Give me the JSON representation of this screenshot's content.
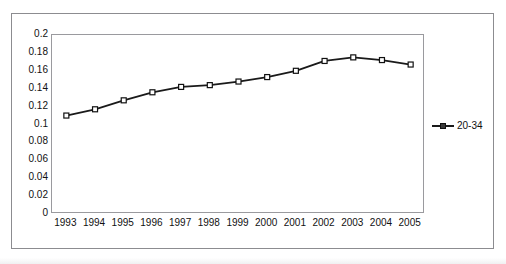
{
  "figure": {
    "cropped_header_text": "",
    "legend_position": "right",
    "grid": false
  },
  "chart_data": {
    "type": "line",
    "title": "",
    "subtitle": "",
    "xlabel": "",
    "ylabel": "",
    "categories": [
      "1993",
      "1994",
      "1995",
      "1996",
      "1997",
      "1998",
      "1999",
      "2000",
      "2001",
      "2002",
      "2003",
      "2004",
      "2005"
    ],
    "series": [
      {
        "name": "20-34",
        "values": [
          0.11,
          0.117,
          0.127,
          0.136,
          0.142,
          0.144,
          0.148,
          0.153,
          0.16,
          0.171,
          0.175,
          0.172,
          0.167
        ],
        "color": "#1a1a1a",
        "marker": "square"
      }
    ],
    "ylim": [
      0,
      0.2
    ],
    "ytick_labels": [
      "0.2",
      "0.18",
      "0.16",
      "0.14",
      "0.12",
      "0.1",
      "0.08",
      "0.06",
      "0.04",
      "0.02",
      "0"
    ],
    "ytick_values": [
      0.2,
      0.18,
      0.16,
      0.14,
      0.12,
      0.1,
      0.08,
      0.06,
      0.04,
      0.02,
      0
    ],
    "legend": [
      "20-34"
    ]
  },
  "colors": {
    "line": "#1a1a1a",
    "marker_fill": "#ffffff",
    "marker_stroke": "#111111",
    "plot_border": "#9a9a9e",
    "outer_border": "#8c8c90",
    "background": "#ffffff",
    "text": "#111111"
  }
}
